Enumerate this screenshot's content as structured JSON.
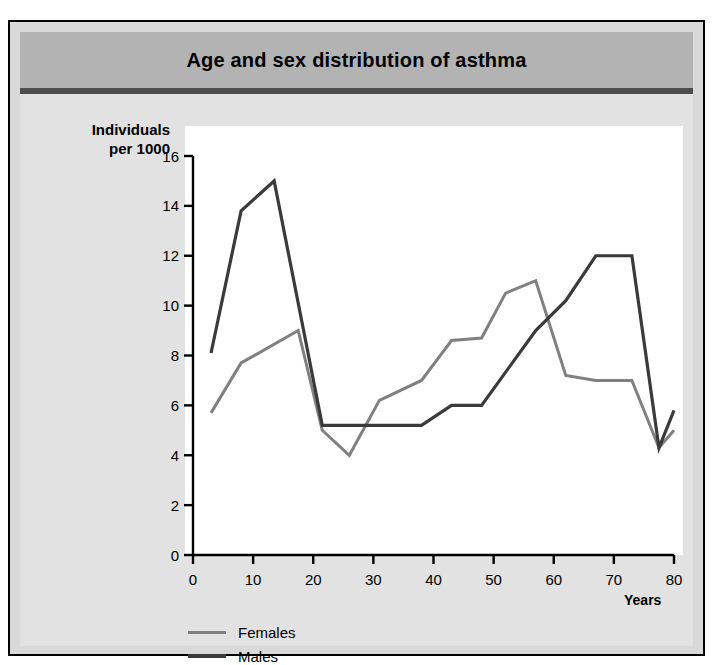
{
  "figure": {
    "title": "Age and sex distribution of asthma",
    "background_color": "#d9d9d9",
    "banner_color": "#b3b3b3",
    "rule_color": "#4d4d4d",
    "plot_background": "#ffffff"
  },
  "axes": {
    "ylabel_line1": "Individuals",
    "ylabel_line2": "per 1000",
    "xlabel": "Years",
    "yticks": [
      "0",
      "2",
      "4",
      "6",
      "8",
      "10",
      "12",
      "14",
      "16"
    ],
    "xticks": [
      "0",
      "10",
      "20",
      "30",
      "40",
      "50",
      "60",
      "70",
      "80"
    ]
  },
  "legend": {
    "items": [
      {
        "label": "Females",
        "color": "#808080"
      },
      {
        "label": "Males",
        "color": "#3a3a3a"
      }
    ]
  },
  "chart_data": {
    "type": "line",
    "title": "Age and sex distribution of asthma",
    "xlabel": "Years",
    "ylabel": "Individuals per 1000",
    "xlim": [
      0,
      80
    ],
    "ylim": [
      0,
      16
    ],
    "xticks": [
      0,
      10,
      20,
      30,
      40,
      50,
      60,
      70,
      80
    ],
    "yticks": [
      0,
      2,
      4,
      6,
      8,
      10,
      12,
      14,
      16
    ],
    "grid": false,
    "legend_position": "below-axes-left",
    "series": [
      {
        "name": "Females",
        "color": "#808080",
        "points": [
          [
            3,
            5.7
          ],
          [
            8,
            7.7
          ],
          [
            17.5,
            9.0
          ],
          [
            21.5,
            5.0
          ],
          [
            26,
            4.0
          ],
          [
            31,
            6.2
          ],
          [
            38,
            7.0
          ],
          [
            43,
            8.6
          ],
          [
            48,
            8.7
          ],
          [
            52,
            10.5
          ],
          [
            57,
            11.0
          ],
          [
            62,
            7.2
          ],
          [
            67,
            7.0
          ],
          [
            73,
            7.0
          ],
          [
            77.5,
            4.3
          ],
          [
            80,
            5.0
          ]
        ]
      },
      {
        "name": "Males",
        "color": "#3a3a3a",
        "points": [
          [
            3,
            8.1
          ],
          [
            8,
            13.8
          ],
          [
            13.5,
            15.0
          ],
          [
            21.5,
            5.2
          ],
          [
            31,
            5.2
          ],
          [
            38,
            5.2
          ],
          [
            43,
            6.0
          ],
          [
            48,
            6.0
          ],
          [
            57,
            9.0
          ],
          [
            62,
            10.2
          ],
          [
            67,
            12.0
          ],
          [
            73,
            12.0
          ],
          [
            77.5,
            4.3
          ],
          [
            80,
            5.8
          ]
        ]
      }
    ]
  },
  "plot_geometry": {
    "left": 183,
    "right": 664,
    "top": 134,
    "bottom": 533
  }
}
